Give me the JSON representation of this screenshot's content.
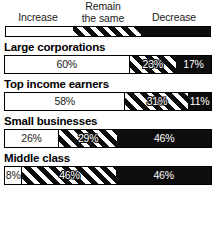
{
  "legend": {
    "increase": "Increase",
    "remain_line1": "Remain",
    "remain_line2": "the same",
    "decrease": "Decrease",
    "swatch": [
      {
        "name": "increase",
        "style": "white",
        "width_pct": 33
      },
      {
        "name": "remain-the-same",
        "style": "stripe",
        "width_pct": 33
      },
      {
        "name": "decrease",
        "style": "black",
        "width_pct": 34
      }
    ]
  },
  "chart_data": {
    "type": "bar",
    "subtype": "stacked-horizontal-100",
    "title": "",
    "xlabel": "",
    "ylabel": "",
    "xlim": [
      0,
      100
    ],
    "grid": false,
    "legend_position": "top",
    "categories": [
      "Large corporations",
      "Top income earners",
      "Small businesses",
      "Middle class"
    ],
    "series": [
      {
        "name": "Increase",
        "fill": "white",
        "values": [
          60,
          58,
          26,
          8
        ]
      },
      {
        "name": "Remain the same",
        "fill": "stripe",
        "values": [
          23,
          31,
          29,
          46
        ]
      },
      {
        "name": "Decrease",
        "fill": "black",
        "values": [
          17,
          11,
          46,
          46
        ]
      }
    ],
    "rows": [
      {
        "label": "Large corporations",
        "segments": [
          {
            "series": "Increase",
            "fill": "white",
            "value": 60,
            "value_label": "60%"
          },
          {
            "series": "Remain the same",
            "fill": "stripe",
            "value": 23,
            "value_label": "23%"
          },
          {
            "series": "Decrease",
            "fill": "black",
            "value": 17,
            "value_label": "17%"
          }
        ]
      },
      {
        "label": "Top income earners",
        "segments": [
          {
            "series": "Increase",
            "fill": "white",
            "value": 58,
            "value_label": "58%"
          },
          {
            "series": "Remain the same",
            "fill": "stripe",
            "value": 31,
            "value_label": "31%"
          },
          {
            "series": "Decrease",
            "fill": "black",
            "value": 11,
            "value_label": "11%"
          }
        ]
      },
      {
        "label": "Small businesses",
        "segments": [
          {
            "series": "Increase",
            "fill": "white",
            "value": 26,
            "value_label": "26%"
          },
          {
            "series": "Remain the same",
            "fill": "stripe",
            "value": 29,
            "value_label": "29%"
          },
          {
            "series": "Decrease",
            "fill": "black",
            "value": 46,
            "value_label": "46%"
          }
        ]
      },
      {
        "label": "Middle class",
        "segments": [
          {
            "series": "Increase",
            "fill": "white",
            "value": 8,
            "value_label": "8%"
          },
          {
            "series": "Remain the same",
            "fill": "stripe",
            "value": 46,
            "value_label": "46%"
          },
          {
            "series": "Decrease",
            "fill": "black",
            "value": 46,
            "value_label": "46%"
          }
        ]
      }
    ]
  },
  "colors": {
    "ink": "#000000",
    "fill_black": "#0d0d0d",
    "fill_white": "#ffffff",
    "background": "#ffffff"
  }
}
